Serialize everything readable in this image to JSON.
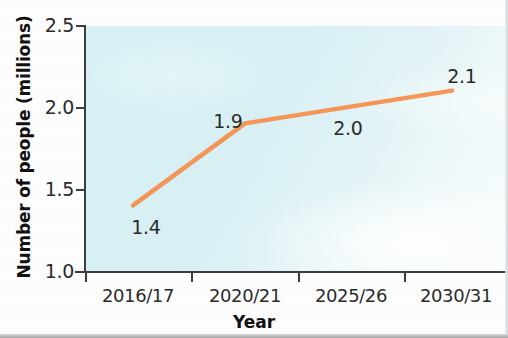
{
  "chart_data": {
    "type": "line",
    "title": "",
    "subtitle": "",
    "xlabel": "Year",
    "ylabel": "Number of people (millions)",
    "categories": [
      "2016/17",
      "2020/21",
      "2025/26",
      "2030/31"
    ],
    "values": [
      1.4,
      1.9,
      2.0,
      2.1
    ],
    "point_labels": [
      "1.4",
      "1.9",
      "2.0",
      "2.1"
    ],
    "series": [
      {
        "name": "Number of people (millions)",
        "values": [
          1.4,
          1.9,
          2.0,
          2.1
        ],
        "color": "#f5904e"
      }
    ],
    "ylim": [
      1.0,
      2.5
    ],
    "yticks": [
      1.0,
      1.5,
      2.0,
      2.5
    ],
    "ytick_labels": [
      "1.0",
      "1.5",
      "2.0",
      "2.5"
    ],
    "xtick_labels": [
      "2016/17",
      "2020/21",
      "2025/26",
      "2030/31"
    ],
    "grid": false,
    "legend": false,
    "legend_position": "none",
    "plot_background_color": "#d8eff3",
    "line_color": "#f5904e",
    "axis_color": "#3c3c3c",
    "text_color": "#2b2b2b",
    "markers": false
  },
  "axes": {
    "y_title": "Number of people (millions)",
    "x_title": "Year",
    "y_tick_labels": [
      "2.5",
      "2.0",
      "1.5",
      "1.0"
    ],
    "x_tick_labels": [
      "2016/17",
      "2020/21",
      "2025/26",
      "2030/31"
    ]
  },
  "data_labels": {
    "p0": "1.4",
    "p1": "1.9",
    "p2": "2.0",
    "p3": "2.1"
  }
}
